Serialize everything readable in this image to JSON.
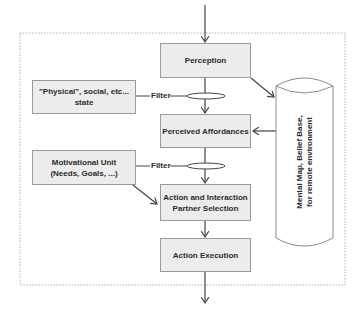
{
  "diagram": {
    "nodes": {
      "perception": "Perception",
      "physical_state_line1": "\"Physical\", social, etc...",
      "physical_state_line2": "state",
      "perceived_affordances": "Perceived Affordances",
      "motivational_unit_line1": "Motivational Unit",
      "motivational_unit_line2": "(Needs, Goals, ...)",
      "action_selection_line1": "Action and Interaction",
      "action_selection_line2": "Partner Selection",
      "action_execution": "Action Execution",
      "mental_map_line1": "Mental Map, Belief Base,",
      "mental_map_line2": "for remote environment"
    },
    "filters": {
      "filter1": "Filter",
      "filter2": "Filter"
    },
    "edges": [
      {
        "from": "input",
        "to": "perception"
      },
      {
        "from": "perception",
        "to": "perceived_affordances",
        "via": "filter1"
      },
      {
        "from": "physical_state",
        "to": "filter1"
      },
      {
        "from": "perception",
        "to": "mental_map"
      },
      {
        "from": "mental_map",
        "to": "perceived_affordances"
      },
      {
        "from": "perceived_affordances",
        "to": "action_selection",
        "via": "filter2"
      },
      {
        "from": "motivational_unit",
        "to": "filter2"
      },
      {
        "from": "motivational_unit",
        "to": "action_selection"
      },
      {
        "from": "action_selection",
        "to": "action_execution"
      },
      {
        "from": "action_execution",
        "to": "output"
      }
    ],
    "colors": {
      "box_fill": "#ececec",
      "box_border": "#9a9a9a",
      "line": "#444444",
      "frame": "#b0b0b0"
    }
  }
}
